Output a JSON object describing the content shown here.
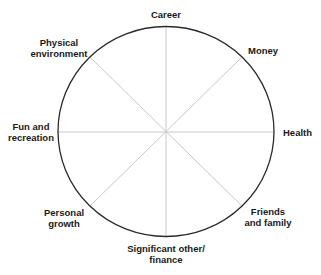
{
  "diagram": {
    "type": "wheel-of-life",
    "center": {
      "x": 166,
      "y": 131
    },
    "radius_x": 108,
    "radius_y": 105,
    "colors": {
      "circle": "#2a2a2a",
      "spokes": "#c8c8c8",
      "text": "#1a1a1a",
      "background": "#ffffff"
    },
    "segments": [
      {
        "label_line1": "Career",
        "label_line2": ""
      },
      {
        "label_line1": "Money",
        "label_line2": ""
      },
      {
        "label_line1": "Health",
        "label_line2": ""
      },
      {
        "label_line1": "Friends",
        "label_line2": "and family"
      },
      {
        "label_line1": "Significant other/",
        "label_line2": "finance"
      },
      {
        "label_line1": "Personal",
        "label_line2": "growth"
      },
      {
        "label_line1": "Fun and",
        "label_line2": "recreation"
      },
      {
        "label_line1": "Physical",
        "label_line2": "environment"
      }
    ]
  }
}
